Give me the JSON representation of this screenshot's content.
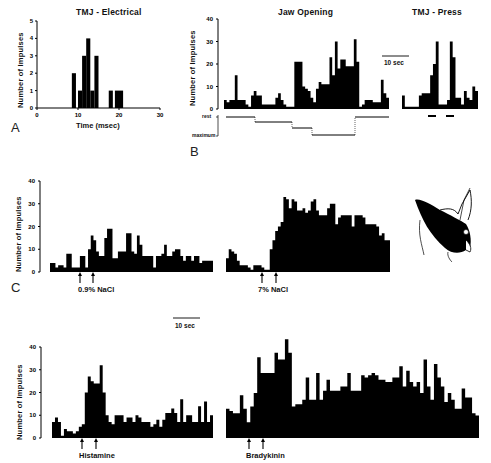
{
  "figure": {
    "panel_letters": [
      "A",
      "B",
      "C"
    ],
    "scale_bar_label": "10 sec",
    "ylabel": "Number of Impulses",
    "cat_head_icon": "cat-head-drawing"
  },
  "chart_data": [
    {
      "id": "A",
      "type": "bar",
      "title": "TMJ - Electrical",
      "xlabel": "Time (msec)",
      "ylabel": "Number of Impulses",
      "xlim": [
        0,
        30
      ],
      "ylim": [
        0,
        5
      ],
      "xticks": [
        0,
        10,
        20,
        30
      ],
      "yticks": [
        0,
        1,
        2,
        3,
        4,
        5
      ],
      "bin_width_msec": 1,
      "x": [
        8.5,
        10,
        11,
        12,
        13,
        14,
        17.5,
        19,
        20
      ],
      "values": [
        2,
        1,
        3,
        4,
        1,
        3,
        1,
        1,
        1
      ],
      "grid": false
    },
    {
      "id": "B-jaw",
      "type": "bar",
      "title": "Jaw Opening",
      "ylabel": "Number of Impulses",
      "ylim": [
        0,
        40
      ],
      "yticks": [
        0,
        10,
        20,
        30,
        40
      ],
      "values": [
        4,
        3,
        4,
        4,
        15,
        4,
        4,
        4,
        2,
        1,
        6,
        8,
        6,
        6,
        2,
        2,
        2,
        2,
        2,
        5,
        7,
        4,
        2,
        1,
        1,
        1,
        21,
        21,
        21,
        10,
        9,
        8,
        5,
        3,
        9,
        12,
        11,
        11,
        11,
        23,
        15,
        30,
        18,
        22,
        22,
        19,
        19,
        19,
        31,
        21,
        1,
        2,
        4,
        4,
        4,
        3,
        3,
        3,
        13,
        7,
        5
      ],
      "jaw_position_trace": {
        "labels": [
          "rest",
          "maximum"
        ],
        "levels": [
          0,
          0.25,
          0.55,
          0.9,
          0
        ]
      },
      "grid": false
    },
    {
      "id": "B-tmj-press",
      "type": "bar",
      "title": "TMJ - Press",
      "ylim": [
        0,
        40
      ],
      "values": [
        6,
        1,
        1,
        1,
        1,
        1,
        6,
        7,
        7,
        7,
        15,
        20,
        30,
        2,
        2,
        2,
        4,
        30,
        23,
        5,
        5,
        2,
        8,
        5,
        4,
        10,
        8
      ],
      "stim_bars": 2,
      "grid": false
    },
    {
      "id": "C-0.9NaCl",
      "type": "bar",
      "ylabel": "Number of Impulses",
      "ylim": [
        0,
        40
      ],
      "yticks": [
        0,
        10,
        20,
        30,
        40
      ],
      "values": [
        4,
        4,
        2,
        3,
        3,
        2,
        8,
        8,
        2,
        2,
        2,
        7,
        7,
        2,
        10,
        16,
        14,
        9,
        7,
        7,
        15,
        19,
        19,
        6,
        6,
        9,
        9,
        9,
        17,
        17,
        9,
        8,
        16,
        12,
        7,
        7,
        7,
        7,
        2,
        7,
        7,
        8,
        12,
        7,
        7,
        9,
        10,
        10,
        7,
        5,
        7,
        7,
        5,
        7,
        7,
        4,
        5,
        5,
        5,
        5
      ],
      "stimulus": "0.9% NaCl",
      "grid": false
    },
    {
      "id": "C-7NaCl",
      "type": "bar",
      "ylim": [
        0,
        40
      ],
      "values": [
        6,
        10,
        9,
        8,
        5,
        3,
        3,
        3,
        2,
        1,
        3,
        3,
        3,
        2,
        1,
        1,
        10,
        14,
        18,
        20,
        22,
        33,
        32,
        28,
        32,
        31,
        27,
        27,
        28,
        26,
        27,
        31,
        32,
        27,
        25,
        25,
        25,
        28,
        30,
        30,
        21,
        24,
        25,
        25,
        25,
        25,
        20,
        25,
        25,
        25,
        24,
        21,
        21,
        21,
        21,
        20,
        16,
        17,
        14,
        14
      ],
      "stimulus": "7% NaCl",
      "grid": false
    },
    {
      "id": "D-histamine",
      "type": "bar",
      "ylabel": "Number of Impulses",
      "ylim": [
        0,
        40
      ],
      "yticks": [
        0,
        10,
        20,
        30,
        40
      ],
      "values": [
        7,
        9,
        7,
        1,
        4,
        3,
        3,
        2,
        3,
        5,
        6,
        20,
        27,
        25,
        24,
        24,
        32,
        20,
        10,
        7,
        6,
        10,
        10,
        10,
        7,
        9,
        9,
        7,
        10,
        9,
        7,
        7,
        7,
        5,
        6,
        8,
        5,
        8,
        11,
        11,
        13,
        11,
        7,
        17,
        7,
        10,
        10,
        7,
        7,
        14,
        7,
        16,
        7,
        10
      ],
      "stimulus": "Histamine",
      "grid": false
    },
    {
      "id": "D-bradykinin",
      "type": "bar",
      "ylim": [
        0,
        45
      ],
      "values": [
        13,
        12,
        11,
        11,
        19,
        13,
        7,
        14,
        20,
        36,
        29,
        29,
        29,
        29,
        38,
        35,
        35,
        44,
        38,
        14,
        15,
        15,
        17,
        27,
        17,
        17,
        29,
        17,
        21,
        26,
        21,
        21,
        21,
        23,
        23,
        29,
        21,
        21,
        21,
        28,
        27,
        28,
        29,
        28,
        26,
        26,
        25,
        25,
        27,
        27,
        32,
        23,
        30,
        25,
        23,
        25,
        20,
        35,
        23,
        17,
        33,
        27,
        23,
        16,
        20,
        17,
        13,
        13,
        22,
        18,
        18,
        11,
        10
      ]
    }
  ],
  "labels": {
    "a_title": "TMJ - Electrical",
    "a_xlabel": "Time (msec)",
    "b_title": "Jaw Opening",
    "b_press_title": "TMJ - Press",
    "rest": "rest",
    "maximum": "maximum",
    "stim_c1": "0.9% NaCl",
    "stim_c2": "7% NaCl",
    "stim_d1": "Histamine",
    "stim_d2": "Bradykinin",
    "scale_bar": "10 sec"
  }
}
